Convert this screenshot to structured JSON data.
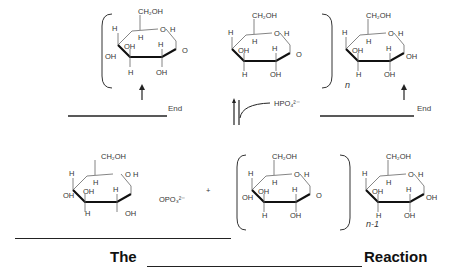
{
  "diagram": {
    "top_row": {
      "glucose_labels": {
        "ch2oh": "CH₂OH",
        "oh": "OH",
        "h": "H",
        "o": "O"
      },
      "repeat_subscript": "n",
      "left_end_label": "End",
      "right_end_label": "End",
      "arrow_icons": [
        "up-arrow",
        "up-arrow"
      ]
    },
    "reagent": {
      "label": "HPO₄²⁻"
    },
    "bottom_row": {
      "product_label_opo3": "OPO₃²⁻",
      "plus": "+",
      "repeat_subscript": "n-1"
    },
    "footer": {
      "prefix": "The",
      "suffix": "Reaction"
    }
  }
}
